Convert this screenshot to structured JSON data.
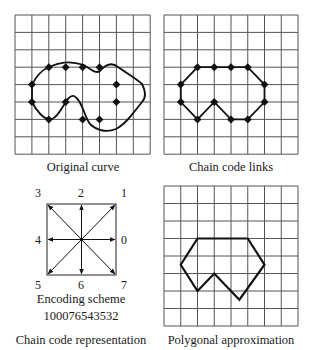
{
  "panels": {
    "original": {
      "caption": "Original curve"
    },
    "links": {
      "caption": "Chain code links"
    },
    "encoding": {
      "title": "Encoding scheme",
      "code": "100076543532",
      "caption": "Chain code representation",
      "directions": {
        "d0": "0",
        "d1": "1",
        "d2": "2",
        "d3": "3",
        "d4": "4",
        "d5": "5",
        "d6": "6",
        "d7": "7"
      }
    },
    "polygon": {
      "caption": "Polygonal approximation"
    }
  },
  "grid": {
    "cols": 8,
    "rows": 8,
    "line_color": "#555555"
  },
  "chain_points": [
    [
      1,
      4
    ],
    [
      2,
      3
    ],
    [
      3,
      3
    ],
    [
      4,
      3
    ],
    [
      5,
      3
    ],
    [
      6,
      4
    ],
    [
      6,
      5
    ],
    [
      5,
      6
    ],
    [
      4,
      6
    ],
    [
      3,
      5
    ],
    [
      2,
      6
    ],
    [
      1,
      5
    ]
  ],
  "polygon_vertices": [
    [
      2,
      3
    ],
    [
      5,
      3
    ],
    [
      6,
      4.5
    ],
    [
      4.5,
      6.5
    ],
    [
      3,
      5
    ],
    [
      2,
      6
    ],
    [
      1,
      4.5
    ]
  ]
}
